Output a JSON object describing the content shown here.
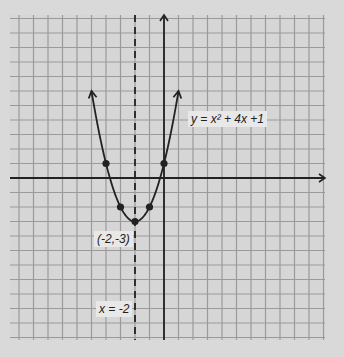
{
  "chart_data": {
    "type": "line",
    "title": "",
    "equation": "y = x² + 4x + 1",
    "equation_label": "y = x² + 4x +1",
    "axis_of_symmetry": -2,
    "axis_of_symmetry_label": "x = -2",
    "vertex": {
      "x": -2,
      "y": -3
    },
    "vertex_label": "(-2,-3)",
    "points": [
      {
        "x": -4,
        "y": 1
      },
      {
        "x": -3,
        "y": -2
      },
      {
        "x": -2,
        "y": -3
      },
      {
        "x": -1,
        "y": -2
      },
      {
        "x": 0,
        "y": 1
      }
    ],
    "grid": true,
    "xlim": [
      -10.5,
      11
    ],
    "ylim": [
      -11,
      11
    ],
    "xlabel": "",
    "ylabel": ""
  },
  "layout": {
    "grid_left": 10,
    "grid_top": 15,
    "grid_right": 325,
    "grid_bottom": 340,
    "cell": 14.5,
    "origin_x": 164,
    "origin_y": 178,
    "colors": {
      "background": "#d9d9d9",
      "grid": "#9a9a9a",
      "axis": "#222222",
      "curve": "#222222"
    }
  },
  "labels": {
    "equation": "y = x² + 4x +1",
    "vertex": "(-2,-3)",
    "symmetry": "x = -2"
  }
}
